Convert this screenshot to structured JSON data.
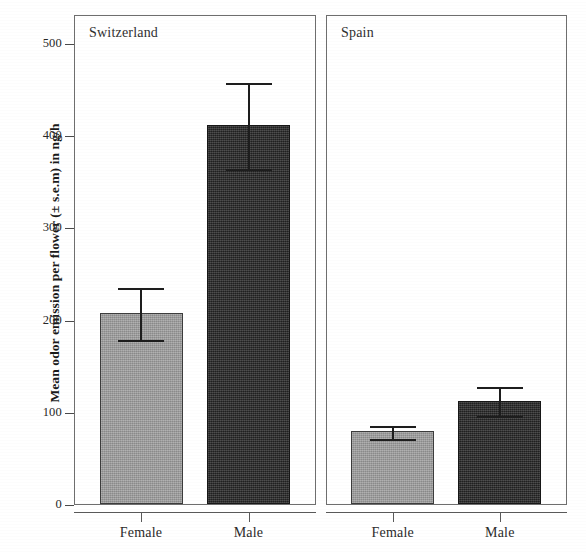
{
  "chart_data": {
    "type": "bar",
    "title": "",
    "xlabel": "",
    "ylabel": "Mean odor emission per flower (± s.e.m) in ng/h",
    "ylim": [
      0,
      520
    ],
    "yticks": [
      0,
      100,
      200,
      300,
      400,
      500
    ],
    "ytick_labels": [
      "0",
      "100",
      "200",
      "300",
      "400",
      "500"
    ],
    "grid": false,
    "legend": "none",
    "error_bars": "± s.e.m",
    "categories": [
      "Female",
      "Male"
    ],
    "panels": [
      {
        "label": "Switzerland",
        "categories": [
          "Female",
          "Male"
        ],
        "values": [
          207,
          411
        ],
        "errors": [
          29,
          48
        ],
        "bars": [
          {
            "category": "Female",
            "value": 207,
            "error": 29,
            "fill": "gray"
          },
          {
            "category": "Male",
            "value": 411,
            "error": 48,
            "fill": "dark"
          }
        ]
      },
      {
        "label": "Spain",
        "categories": [
          "Female",
          "Male"
        ],
        "values": [
          79,
          112
        ],
        "errors": [
          8,
          17
        ],
        "bars": [
          {
            "category": "Female",
            "value": 79,
            "error": 8,
            "fill": "gray"
          },
          {
            "category": "Male",
            "value": 112,
            "error": 17,
            "fill": "dark"
          }
        ]
      }
    ],
    "colors": {
      "female_bar": "#9b9b9b",
      "male_bar": "#2b2b2b",
      "axis": "#5a5a5a",
      "text": "#1b1b1b",
      "background": "#ffffff"
    }
  }
}
